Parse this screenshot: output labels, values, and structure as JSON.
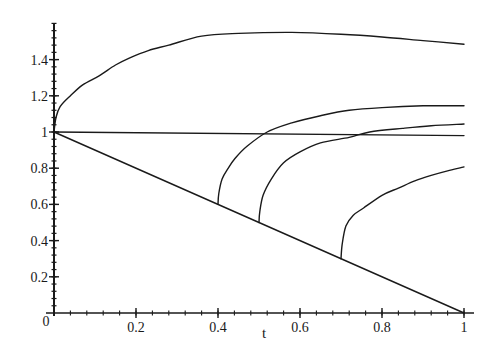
{
  "chart_data": {
    "type": "line",
    "title": "",
    "xlabel": "t",
    "ylabel": "",
    "xlim": [
      0,
      1
    ],
    "ylim": [
      0,
      1.6
    ],
    "grid": false,
    "legend": null,
    "x_ticks": [
      0,
      0.2,
      0.4,
      0.6,
      0.8,
      1
    ],
    "x_tick_labels": [
      "0",
      "0.2",
      "0.4",
      "0.6",
      "0.8",
      "1"
    ],
    "y_ticks": [
      0.2,
      0.4,
      0.6,
      0.8,
      1,
      1.2,
      1.4
    ],
    "y_tick_labels": [
      "0.2",
      "0.4",
      "0.6",
      "0.8",
      "1",
      "1.2",
      "1.4"
    ],
    "origin_label": "0",
    "series": [
      {
        "name": "upper-curve",
        "points": [
          [
            0,
            1.0
          ],
          [
            0.005,
            1.08
          ],
          [
            0.015,
            1.14
          ],
          [
            0.04,
            1.2
          ],
          [
            0.07,
            1.26
          ],
          [
            0.11,
            1.31
          ],
          [
            0.15,
            1.37
          ],
          [
            0.185,
            1.41
          ],
          [
            0.23,
            1.45
          ],
          [
            0.28,
            1.48
          ],
          [
            0.36,
            1.53
          ],
          [
            0.45,
            1.545
          ],
          [
            0.58,
            1.55
          ],
          [
            0.7,
            1.54
          ],
          [
            0.8,
            1.525
          ],
          [
            0.9,
            1.505
          ],
          [
            1.0,
            1.485
          ]
        ]
      },
      {
        "name": "constant-line",
        "points": [
          [
            0,
            1.0
          ],
          [
            1.0,
            0.98
          ]
        ]
      },
      {
        "name": "diagonal-line",
        "points": [
          [
            0,
            1.0
          ],
          [
            1.0,
            0.0
          ]
        ]
      },
      {
        "name": "branch-t0.4",
        "points": [
          [
            0.4,
            0.6
          ],
          [
            0.402,
            0.66
          ],
          [
            0.41,
            0.74
          ],
          [
            0.425,
            0.8
          ],
          [
            0.44,
            0.85
          ],
          [
            0.47,
            0.92
          ],
          [
            0.52,
            1.0
          ],
          [
            0.58,
            1.05
          ],
          [
            0.65,
            1.09
          ],
          [
            0.72,
            1.12
          ],
          [
            0.8,
            1.135
          ],
          [
            0.9,
            1.145
          ],
          [
            1.0,
            1.145
          ]
        ]
      },
      {
        "name": "branch-t0.5",
        "points": [
          [
            0.5,
            0.5
          ],
          [
            0.502,
            0.56
          ],
          [
            0.51,
            0.65
          ],
          [
            0.53,
            0.74
          ],
          [
            0.56,
            0.83
          ],
          [
            0.6,
            0.89
          ],
          [
            0.65,
            0.94
          ],
          [
            0.72,
            0.97
          ],
          [
            0.77,
            1.0
          ],
          [
            0.85,
            1.02
          ],
          [
            0.92,
            1.035
          ],
          [
            1.0,
            1.044
          ]
        ]
      },
      {
        "name": "branch-t0.7",
        "points": [
          [
            0.7,
            0.3
          ],
          [
            0.703,
            0.38
          ],
          [
            0.712,
            0.48
          ],
          [
            0.73,
            0.54
          ],
          [
            0.755,
            0.58
          ],
          [
            0.8,
            0.65
          ],
          [
            0.84,
            0.69
          ],
          [
            0.88,
            0.73
          ],
          [
            0.92,
            0.76
          ],
          [
            0.96,
            0.785
          ],
          [
            1.0,
            0.807
          ]
        ]
      }
    ]
  },
  "colors": {
    "line": "#1a1a1a",
    "background": "#ffffff"
  }
}
